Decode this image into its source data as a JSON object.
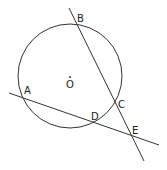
{
  "diagram": {
    "circle": {
      "center_label": "O",
      "cx": 70,
      "cy": 76,
      "r": 52
    },
    "points": [
      {
        "label": "B",
        "x": 74,
        "y": 23,
        "lx": 77,
        "ly": 22
      },
      {
        "label": "O",
        "x": 70,
        "y": 77,
        "lx": 66,
        "ly": 88
      },
      {
        "label": "A",
        "x": 22,
        "y": 97,
        "lx": 24,
        "ly": 94
      },
      {
        "label": "C",
        "x": 115,
        "y": 102,
        "lx": 118,
        "ly": 108
      },
      {
        "label": "D",
        "x": 95,
        "y": 123,
        "lx": 91,
        "ly": 120
      },
      {
        "label": "E",
        "x": 133,
        "y": 136,
        "lx": 132,
        "ly": 134
      }
    ],
    "lines": [
      {
        "name": "line-BE",
        "x1": 69,
        "y1": 8,
        "x2": 144,
        "y2": 161
      },
      {
        "name": "line-AE",
        "x1": 9,
        "y1": 93,
        "x2": 159,
        "y2": 145
      }
    ],
    "stroke_color": "#333333"
  }
}
